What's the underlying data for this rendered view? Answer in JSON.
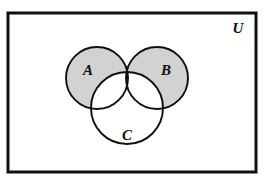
{
  "figure": {
    "type": "venn-diagram",
    "universe_label": "U",
    "background_color": "#ffffff",
    "stroke_color": "#101010",
    "shade_color": "#d4d2d0",
    "frame": {
      "x": 8,
      "y": 13,
      "width": 248,
      "height": 159,
      "border_width": 3
    },
    "sets": [
      {
        "key": "A",
        "label": "A",
        "cx": 97,
        "cy": 78,
        "r": 31,
        "label_x": 88,
        "label_y": 75,
        "shaded": true
      },
      {
        "key": "B",
        "label": "B",
        "cx": 157,
        "cy": 78,
        "r": 31,
        "label_x": 166,
        "label_y": 75,
        "shaded": true
      },
      {
        "key": "C",
        "label": "C",
        "cx": 127,
        "cy": 108,
        "r": 36,
        "label_x": 127,
        "label_y": 140,
        "shaded": false
      }
    ],
    "universe_label_position": {
      "x": 238,
      "y": 33
    },
    "shaded_region": {
      "expression": "(A ∪ B) − C",
      "color": "#d4d2d0"
    },
    "label_font_size": 15,
    "universe_font_size": 15
  }
}
